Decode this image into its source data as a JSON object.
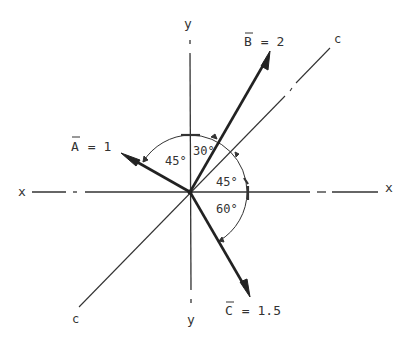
{
  "diagram": {
    "axes": {
      "x_label_left": "x",
      "x_label_right": "x",
      "y_label_top": "y",
      "y_label_bottom": "y",
      "c_label_top": "c",
      "c_label_bottom": "c"
    },
    "vectors": [
      {
        "name": "A",
        "label": "A = 1",
        "magnitude": 1,
        "angle_from_y_deg": 45,
        "direction": "upper-left"
      },
      {
        "name": "B",
        "label": "B = 2",
        "magnitude": 2,
        "angle_from_y_deg": 30,
        "direction": "upper-right"
      },
      {
        "name": "C",
        "label": "C = 1.5",
        "magnitude": 1.5,
        "angle_below_x_deg": 60,
        "direction": "lower-right"
      }
    ],
    "angles": {
      "a_to_y": "45°",
      "y_to_b": "30°",
      "c_line_to_x": "45°",
      "x_to_c": "60°"
    },
    "labels": {
      "a_letter": "A",
      "a_value": " = 1",
      "b_letter": "B",
      "b_value": " = 2",
      "c_letter": "C",
      "c_value": " = 1.5"
    }
  }
}
